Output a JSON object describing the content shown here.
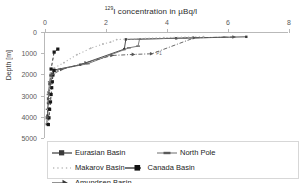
{
  "chart_data": {
    "type": "line",
    "title": "129I concentration in µBq/l",
    "title_sup": "129",
    "title_rest": "I concentration in µBq/l",
    "orientation": "depth-profile",
    "xlabel": "",
    "ylabel": "Depth [m]",
    "xlim": [
      0,
      8
    ],
    "ylim": [
      0,
      5000
    ],
    "y_inverted": true,
    "grid": false,
    "legend_position": "bottom",
    "xticks": [
      0,
      2,
      4,
      6,
      8
    ],
    "xtick_labels": [
      "0",
      "2",
      "4",
      "6",
      "8"
    ],
    "yticks": [
      0,
      1000,
      2000,
      3000,
      4000,
      5000
    ],
    "ytick_labels": [
      "0",
      "1000",
      "2000",
      "3000",
      "4000",
      "5000"
    ],
    "annotations": [
      {
        "text": "P1",
        "x": 3.55,
        "y": 980
      }
    ],
    "series": [
      {
        "name": "Eurasian Basin",
        "color": "#3a3a3a",
        "style": "solid",
        "marker": "square",
        "points": [
          {
            "x": 6.6,
            "y": 180
          },
          {
            "x": 4.3,
            "y": 250
          },
          {
            "x": 2.65,
            "y": 300
          },
          {
            "x": 2.6,
            "y": 760
          },
          {
            "x": 1.15,
            "y": 1500
          },
          {
            "x": 0.28,
            "y": 1750
          },
          {
            "x": 0.18,
            "y": 2000
          },
          {
            "x": 0.15,
            "y": 2400
          },
          {
            "x": 0.12,
            "y": 2800
          },
          {
            "x": 0.1,
            "y": 3300
          },
          {
            "x": 0.08,
            "y": 3900
          },
          {
            "x": 0.06,
            "y": 4300
          }
        ]
      },
      {
        "name": "North Pole",
        "color": "#6e6e6e",
        "style": "solid",
        "marker": "dash",
        "points": [
          {
            "x": 5.9,
            "y": 200
          },
          {
            "x": 4.6,
            "y": 230
          },
          {
            "x": 3.1,
            "y": 290
          },
          {
            "x": 3.05,
            "y": 620
          },
          {
            "x": 2.75,
            "y": 700
          },
          {
            "x": 1.4,
            "y": 1450
          },
          {
            "x": 0.5,
            "y": 1700
          },
          {
            "x": 0.22,
            "y": 1900
          },
          {
            "x": 0.16,
            "y": 2300
          },
          {
            "x": 0.12,
            "y": 2900
          },
          {
            "x": 0.09,
            "y": 3600
          }
        ]
      },
      {
        "name": "Makarov Basin",
        "color": "#b5b5b5",
        "style": "dotted",
        "marker": "dot",
        "points": [
          {
            "x": 5.2,
            "y": 175
          },
          {
            "x": 3.9,
            "y": 215
          },
          {
            "x": 2.35,
            "y": 310
          },
          {
            "x": 2.15,
            "y": 430
          },
          {
            "x": 1.9,
            "y": 520
          },
          {
            "x": 1.5,
            "y": 720
          },
          {
            "x": 1.05,
            "y": 1020
          },
          {
            "x": 0.62,
            "y": 1400
          },
          {
            "x": 0.3,
            "y": 1650
          },
          {
            "x": 0.2,
            "y": 1900
          },
          {
            "x": 0.15,
            "y": 2500
          },
          {
            "x": 0.1,
            "y": 3400
          },
          {
            "x": 0.07,
            "y": 4250
          }
        ]
      },
      {
        "name": "Canada Basin",
        "color": "#161616",
        "style": "dashed",
        "marker": "square-filled",
        "points": [
          {
            "x": 0.42,
            "y": 760
          },
          {
            "x": 0.3,
            "y": 900
          },
          {
            "x": 0.2,
            "y": 1700
          },
          {
            "x": 0.3,
            "y": 1760
          },
          {
            "x": 0.26,
            "y": 1980
          },
          {
            "x": 0.24,
            "y": 2300
          },
          {
            "x": 0.22,
            "y": 2580
          },
          {
            "x": 0.2,
            "y": 2900
          },
          {
            "x": 0.18,
            "y": 3250
          },
          {
            "x": 0.15,
            "y": 3600
          },
          {
            "x": 0.13,
            "y": 4000
          },
          {
            "x": 0.11,
            "y": 4320
          }
        ]
      },
      {
        "name": "Amundsen Basin",
        "color": "#555555",
        "style": "dash-dot",
        "marker": "arrow",
        "points": [
          {
            "x": 6.2,
            "y": 190
          },
          {
            "x": 4.9,
            "y": 225
          },
          {
            "x": 3.5,
            "y": 980
          },
          {
            "x": 2.9,
            "y": 1010
          },
          {
            "x": 2.2,
            "y": 1060
          },
          {
            "x": 1.35,
            "y": 1400
          },
          {
            "x": 0.55,
            "y": 1720
          },
          {
            "x": 0.25,
            "y": 1950
          },
          {
            "x": 0.18,
            "y": 2400
          },
          {
            "x": 0.12,
            "y": 3100
          },
          {
            "x": 0.08,
            "y": 4000
          }
        ]
      }
    ]
  },
  "legend": {
    "items": [
      {
        "label": "Eurasian Basin",
        "marker": "square-line-marker"
      },
      {
        "label": "North Pole",
        "marker": "dash-line-marker"
      },
      {
        "label": "Makarov Basin",
        "marker": "dotted-line-marker"
      },
      {
        "label": "Canada Basin",
        "marker": "square-filled-marker"
      },
      {
        "label": "Amundsen Basin",
        "marker": "arrow-line-marker"
      }
    ]
  }
}
